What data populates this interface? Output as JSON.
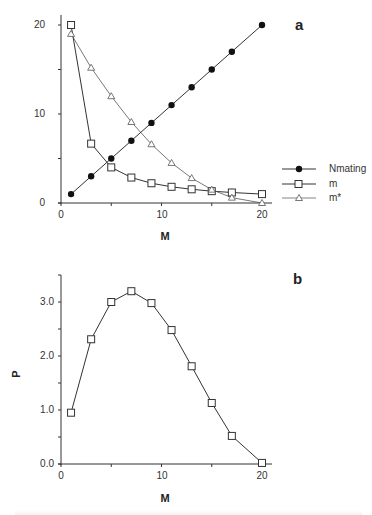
{
  "chart_data": [
    {
      "panel": "a",
      "type": "line",
      "xlabel": "M",
      "ylabel": "",
      "xlim": [
        0,
        21
      ],
      "ylim": [
        0,
        21
      ],
      "x_ticks": [
        "0",
        "10",
        "20"
      ],
      "y_ticks": [
        "0",
        "10",
        "20"
      ],
      "grid": false,
      "legend_position": "right",
      "x": [
        1,
        3,
        5,
        7,
        9,
        11,
        13,
        15,
        17,
        20
      ],
      "series": [
        {
          "name": "Nmating",
          "marker": "filled-circle",
          "values": [
            1,
            3,
            5,
            7,
            9,
            11,
            13,
            15,
            17,
            20
          ]
        },
        {
          "name": "m",
          "marker": "open-square",
          "values": [
            20,
            6.67,
            4.0,
            2.86,
            2.22,
            1.82,
            1.54,
            1.33,
            1.18,
            1.0
          ]
        },
        {
          "name": "m*",
          "marker": "open-triangle",
          "values": [
            19,
            15.2,
            12,
            9.1,
            6.6,
            4.5,
            2.8,
            1.5,
            0.6,
            0
          ]
        }
      ]
    },
    {
      "panel": "b",
      "type": "line",
      "xlabel": "M",
      "ylabel": "P",
      "xlim": [
        0,
        21
      ],
      "ylim": [
        0,
        3.5
      ],
      "x_ticks": [
        "0",
        "10",
        "20"
      ],
      "y_ticks": [
        "0.0",
        "1.0",
        "2.0",
        "3.0"
      ],
      "grid": false,
      "x": [
        1,
        3,
        5,
        7,
        9,
        11,
        13,
        15,
        17,
        20
      ],
      "series": [
        {
          "name": "P",
          "marker": "open-square",
          "values": [
            0.95,
            2.31,
            3.0,
            3.2,
            2.98,
            2.48,
            1.81,
            1.13,
            0.52,
            0.02
          ]
        }
      ]
    }
  ],
  "labels": {
    "panel_a": "a",
    "panel_b": "b",
    "xlabel_a": "M",
    "xlabel_b": "M",
    "ylabel_b": "P",
    "a_x_ticks": [
      "0",
      "10",
      "20"
    ],
    "a_y_ticks": [
      "0",
      "10",
      "20"
    ],
    "b_x_ticks": [
      "0",
      "10",
      "20"
    ],
    "b_y_ticks": [
      "0.0",
      "1.0",
      "2.0",
      "3.0"
    ],
    "legend": [
      "Nmating",
      "m",
      "m*"
    ]
  }
}
